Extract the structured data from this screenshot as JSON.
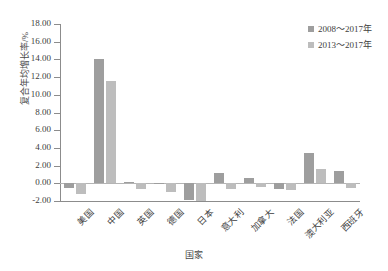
{
  "chart_data": {
    "type": "bar",
    "title": "",
    "xlabel": "国家",
    "ylabel": "复合年均增长率/%",
    "categories": [
      "美国",
      "中国",
      "英国",
      "德国",
      "日本",
      "意大利",
      "加拿大",
      "法国",
      "澳大利亚",
      "西班牙"
    ],
    "series": [
      {
        "name": "2008～2017年",
        "color": "#9e9e9e",
        "values": [
          -0.5,
          14.1,
          0.1,
          -0.1,
          -1.9,
          1.15,
          0.55,
          -0.6,
          3.4,
          1.35
        ]
      },
      {
        "name": "2013～2017年",
        "color": "#bdbdbd",
        "values": [
          -1.2,
          11.6,
          -0.7,
          -1.0,
          -1.95,
          -0.6,
          -0.45,
          -0.75,
          1.6,
          -0.5
        ]
      }
    ],
    "ylim": [
      -2.0,
      18.0
    ],
    "ytick_step": 2.0,
    "ytick_labels": [
      "18.00",
      "16.00",
      "14.00",
      "12.00",
      "10.00",
      "8.00",
      "6.00",
      "4.00",
      "2.00",
      "0.00",
      "-2.00"
    ],
    "grid": false,
    "legend_position": "top-right"
  },
  "legend": {
    "entries": [
      {
        "label": "2008～2017年"
      },
      {
        "label": "2013～2017年"
      }
    ]
  },
  "axes": {
    "y_title": "复合年均增长率/%",
    "x_title": "国家"
  }
}
